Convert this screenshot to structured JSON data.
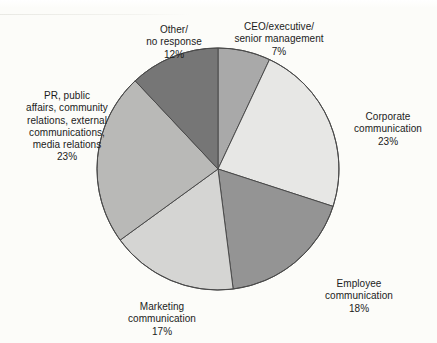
{
  "chart_data": {
    "type": "pie",
    "title": "",
    "subtitle": "",
    "xlabel": "",
    "ylabel": "",
    "legend_position": "none",
    "grid": false,
    "units": "percent",
    "center": {
      "x": 218,
      "y": 169
    },
    "radius": 121,
    "start_angle_deg": 0,
    "direction": "clockwise",
    "categories": [
      "CEO/executive/senior management",
      "Corporate communication",
      "Employee communication",
      "Marketing communication",
      "PR, public affairs, community relations, external communications, media relations",
      "Other/no response"
    ],
    "values": [
      7,
      23,
      18,
      17,
      23,
      12
    ],
    "colors": [
      "#a9a9a9",
      "#e7e7e5",
      "#949494",
      "#d5d5d3",
      "#b9b9b7",
      "#767676"
    ],
    "stroke": "#4a4a4a",
    "slices": [
      {
        "key": "ceo",
        "label_lines": [
          "CEO/executive/",
          "senior management"
        ],
        "value": 7,
        "value_text": "7%",
        "color": "#a9a9a9"
      },
      {
        "key": "corporate",
        "label_lines": [
          "Corporate",
          "communication"
        ],
        "value": 23,
        "value_text": "23%",
        "color": "#e7e7e5"
      },
      {
        "key": "employee",
        "label_lines": [
          "Employee",
          "communication"
        ],
        "value": 18,
        "value_text": "18%",
        "color": "#949494"
      },
      {
        "key": "marketing",
        "label_lines": [
          "Marketing",
          "communication"
        ],
        "value": 17,
        "value_text": "17%",
        "color": "#d5d5d3"
      },
      {
        "key": "pr",
        "label_lines": [
          "PR, public",
          "affairs, community",
          "relations, external",
          "communications,",
          "media relations"
        ],
        "value": 23,
        "value_text": "23%",
        "color": "#b9b9b7"
      },
      {
        "key": "other",
        "label_lines": [
          "Other/",
          "no response"
        ],
        "value": 12,
        "value_text": "12%",
        "color": "#767676"
      }
    ]
  },
  "labels": {
    "ceo": {
      "text": "CEO/executive/\nsenior management",
      "pct": "7%"
    },
    "corporate": {
      "text": "Corporate\ncommunication",
      "pct": "23%"
    },
    "employee": {
      "text": "Employee\ncommunication",
      "pct": "18%"
    },
    "marketing": {
      "text": "Marketing\ncommunication",
      "pct": "17%"
    },
    "pr": {
      "text": "PR, public\naffairs, community\nrelations, external\ncommunications,\nmedia relations",
      "pct": "23%"
    },
    "other": {
      "text": "Other/\nno response",
      "pct": "12%"
    }
  },
  "background": {
    "page_color": "#fcfcf9",
    "text_color": "#1b1b1b"
  }
}
